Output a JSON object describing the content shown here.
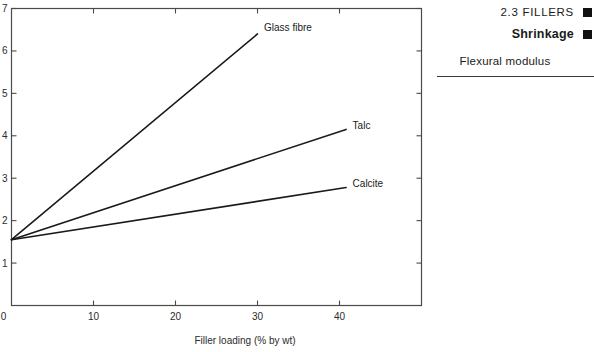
{
  "header_panel": {
    "running_head": "2.3  FILLERS",
    "running_head_marker": "black-square-marker",
    "section_title": "Shrinkage",
    "section_title_marker": "black-square-marker",
    "figure_caption": "Flexural modulus"
  },
  "chart_data": {
    "type": "line",
    "title": "",
    "xlabel": "Filler loading (% by wt)",
    "ylabel": "",
    "xlim": [
      0,
      50
    ],
    "ylim": [
      0,
      7
    ],
    "xticks": [
      0,
      10,
      20,
      30,
      40
    ],
    "xticklabels": [
      "0",
      "10",
      "20",
      "30",
      "40"
    ],
    "yticks": [
      1,
      2,
      3,
      4,
      5,
      6,
      7
    ],
    "yticklabels": [
      "1",
      "2",
      "3",
      "4",
      "5",
      "6",
      "7"
    ],
    "grid": false,
    "legend": "inline-end-of-line-labels",
    "frame": "box-with-inward-ticks-all-sides",
    "line_color": "#1a1a1a",
    "axis_color": "#4a4a4a",
    "series": [
      {
        "name": "Glass fibre",
        "label": "Glass fibre",
        "x": [
          0,
          30
        ],
        "values": [
          1.55,
          6.4
        ],
        "label_x": 30.8,
        "label_y": 6.55
      },
      {
        "name": "Talc",
        "label": "Talc",
        "x": [
          0,
          40.8
        ],
        "values": [
          1.55,
          4.15
        ],
        "label_x": 41.6,
        "label_y": 4.25
      },
      {
        "name": "Calcite",
        "label": "Calcite",
        "x": [
          0,
          40.8
        ],
        "values": [
          1.55,
          2.78
        ],
        "label_x": 41.6,
        "label_y": 2.88
      }
    ]
  }
}
